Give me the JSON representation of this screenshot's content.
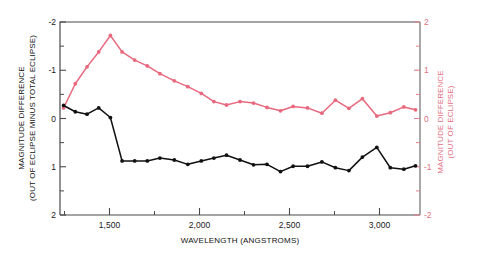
{
  "chart_data": {
    "type": "line",
    "title": "",
    "subtitle": "",
    "xlabel": "WAVELENGTH (ANGSTROMS)",
    "ylabel_left": "MAGNITUDE DIFFERENCE (OUT OF ECLIPSE MINUS TOTAL ECLIPSE)",
    "ylabel_right": "MAGNITUDE DIFFERENCE (OUT OF ECLIPSE)",
    "xlim": [
      1225,
      3225
    ],
    "ylim_left": [
      -2,
      2
    ],
    "ylim_right": [
      -2,
      2
    ],
    "y_left_inverted": true,
    "y_right_inverted": false,
    "grid": false,
    "legend": "none",
    "xticks": [
      1500,
      2000,
      2500,
      3000
    ],
    "xticklabels": [
      "1,500",
      "2,000",
      "2,500",
      "3,000"
    ],
    "xticks_minor": [
      1250,
      1750,
      2250,
      2750,
      3250
    ],
    "yticks_left": [
      -2,
      -1,
      0,
      1,
      2
    ],
    "yticklabels_left": [
      "-2",
      "-1",
      "0",
      "1",
      "2"
    ],
    "yticks_left_minor": [
      -1.5,
      -0.5,
      0.5,
      1.5
    ],
    "yticks_right": [
      2,
      1,
      0,
      -1,
      -2
    ],
    "yticklabels_right": [
      "2",
      "1",
      "0",
      "-1",
      "-2"
    ],
    "yticks_right_minor": [
      1.5,
      0.5,
      -0.5,
      -1.5
    ],
    "colors": {
      "series_out_of_eclipse": "#e8697e",
      "series_difference": "#111111",
      "axis": "#4a4a4a",
      "axis_right": "#e0808f",
      "background": "#ffffff"
    },
    "series": [
      {
        "name": "MAGNITUDE DIFFERENCE (OUT OF ECLIPSE)",
        "axis": "right",
        "color": "#e8697e",
        "marker": "circle",
        "x": [
          1245,
          1310,
          1375,
          1440,
          1505,
          1570,
          1640,
          1710,
          1780,
          1860,
          1935,
          2010,
          2080,
          2150,
          2225,
          2300,
          2375,
          2450,
          2520,
          2600,
          2680,
          2755,
          2830,
          2905,
          2985,
          3060,
          3135,
          3200
        ],
        "y": [
          0.22,
          0.72,
          1.07,
          1.38,
          1.72,
          1.38,
          1.21,
          1.09,
          0.93,
          0.78,
          0.66,
          0.52,
          0.35,
          0.28,
          0.35,
          0.32,
          0.23,
          0.16,
          0.25,
          0.22,
          0.11,
          0.38,
          0.21,
          0.41,
          0.05,
          0.12,
          0.24,
          0.18
        ]
      },
      {
        "name": "MAGNITUDE DIFFERENCE (OUT OF ECLIPSE MINUS TOTAL ECLIPSE)",
        "axis": "left",
        "color": "#111111",
        "marker": "circle",
        "x": [
          1245,
          1310,
          1375,
          1440,
          1505,
          1570,
          1640,
          1710,
          1780,
          1860,
          1935,
          2010,
          2080,
          2150,
          2225,
          2300,
          2375,
          2450,
          2520,
          2600,
          2680,
          2755,
          2830,
          2905,
          2985,
          3060,
          3135,
          3200
        ],
        "y": [
          -0.27,
          -0.14,
          -0.09,
          -0.22,
          -0.02,
          0.88,
          0.88,
          0.88,
          0.82,
          0.86,
          0.95,
          0.88,
          0.82,
          0.76,
          0.86,
          0.96,
          0.95,
          1.1,
          0.99,
          0.99,
          0.9,
          1.02,
          1.08,
          0.8,
          0.6,
          1.02,
          1.05,
          0.98
        ]
      }
    ]
  }
}
